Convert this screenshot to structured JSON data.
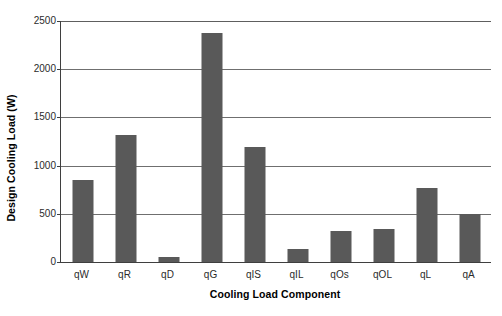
{
  "chart_data": {
    "type": "bar",
    "title": "",
    "xlabel": "Cooling Load Component",
    "ylabel": "Design Cooling Load (W)",
    "categories": [
      "qW",
      "qR",
      "qD",
      "qG",
      "qIS",
      "qIL",
      "qOs",
      "qOL",
      "qL",
      "qA"
    ],
    "values": [
      850,
      1320,
      50,
      2380,
      1190,
      130,
      320,
      345,
      770,
      500
    ],
    "series": [
      {
        "name": "Design Cooling Load",
        "values": [
          850,
          1320,
          50,
          2380,
          1190,
          130,
          320,
          345,
          770,
          500
        ]
      }
    ],
    "ylim": [
      0,
      2500
    ],
    "yticks": [
      0,
      500,
      1000,
      1500,
      2000,
      2500
    ],
    "ytick_labels": [
      "0",
      "500",
      "1000",
      "1500",
      "2000",
      "2500"
    ],
    "grid": "horizontal",
    "legend": "none",
    "bar_color": "#595959",
    "axis_color": "#3f3f3f",
    "gridline_color": "#6f6f6f",
    "background": "#ffffff"
  }
}
